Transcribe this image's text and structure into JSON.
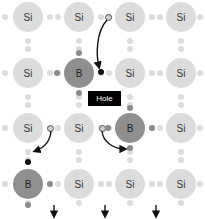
{
  "diagram": {
    "atom_radius": 15,
    "columns_x": [
      28,
      79,
      130,
      181
    ],
    "rows_y": [
      17,
      73,
      128,
      184
    ],
    "atoms": [
      {
        "label": "Si",
        "type": "si",
        "row": 0,
        "col": 0
      },
      {
        "label": "Si",
        "type": "si",
        "row": 0,
        "col": 1
      },
      {
        "label": "Si",
        "type": "si",
        "row": 0,
        "col": 2
      },
      {
        "label": "Si",
        "type": "si",
        "row": 0,
        "col": 3
      },
      {
        "label": "Si",
        "type": "si",
        "row": 1,
        "col": 0
      },
      {
        "label": "B",
        "type": "b",
        "row": 1,
        "col": 1
      },
      {
        "label": "Si",
        "type": "si",
        "row": 1,
        "col": 2
      },
      {
        "label": "Si",
        "type": "si",
        "row": 1,
        "col": 3
      },
      {
        "label": "Si",
        "type": "si",
        "row": 2,
        "col": 0
      },
      {
        "label": "Si",
        "type": "si",
        "row": 2,
        "col": 1
      },
      {
        "label": "B",
        "type": "b",
        "row": 2,
        "col": 2
      },
      {
        "label": "Si",
        "type": "si",
        "row": 2,
        "col": 3
      },
      {
        "label": "B",
        "type": "b",
        "row": 3,
        "col": 0
      },
      {
        "label": "Si",
        "type": "si",
        "row": 3,
        "col": 1
      },
      {
        "label": "Si",
        "type": "si",
        "row": 3,
        "col": 2
      },
      {
        "label": "Si",
        "type": "si",
        "row": 3,
        "col": 3
      }
    ],
    "hole_label": "Hole",
    "hole_box": {
      "x": 88,
      "y": 91,
      "w": 33,
      "h": 15
    },
    "colors": {
      "silicon": "#dcdcdc",
      "boron": "#8f8f8f",
      "electron_dark": "#8c8c8c",
      "hole": "#111111",
      "arrow": "#111111"
    }
  }
}
